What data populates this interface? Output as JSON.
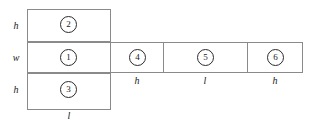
{
  "diagram": {
    "stroke_color": "#8a8a8a",
    "circle_color": "#2b2b2b",
    "text_color": "#1a1a1a",
    "background": "#ffffff",
    "faces": [
      {
        "number": "2",
        "position": "top-of-left-column"
      },
      {
        "number": "1",
        "position": "middle-of-left-column"
      },
      {
        "number": "3",
        "position": "bottom-of-left-column"
      },
      {
        "number": "4",
        "position": "strip-first"
      },
      {
        "number": "5",
        "position": "strip-second"
      },
      {
        "number": "6",
        "position": "strip-third"
      }
    ],
    "labels": {
      "left_top": "h",
      "left_middle": "w",
      "left_bottom": "h",
      "bottom_left_column": "l",
      "strip_first": "h",
      "strip_second": "l",
      "strip_third": "h"
    }
  }
}
